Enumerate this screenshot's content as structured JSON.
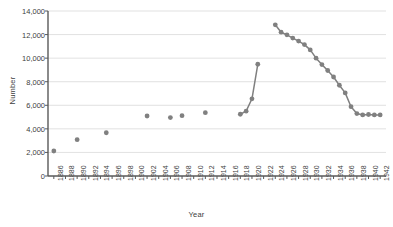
{
  "chart_data": {
    "type": "scatter",
    "title": "",
    "xlabel": "Year",
    "ylabel": "Number",
    "xlim": [
      1885,
      1943
    ],
    "ylim": [
      0,
      14000
    ],
    "grid": true,
    "legend": false,
    "marker_color": "#808080",
    "line_color": "#808080",
    "axis_color": "#595959",
    "grid_color": "#d9d9d9",
    "text_color": "#404040",
    "ytick_labels": [
      "0",
      "2,000",
      "4,000",
      "6,000",
      "8,000",
      "10,000",
      "12,000",
      "14,000"
    ],
    "ytick_values": [
      0,
      2000,
      4000,
      6000,
      8000,
      10000,
      12000,
      14000
    ],
    "xtick_labels": [
      "1886",
      "1888",
      "1890",
      "1892",
      "1894",
      "1896",
      "1898",
      "1900",
      "1902",
      "1904",
      "1906",
      "1908",
      "1910",
      "1912",
      "1914",
      "1916",
      "1918",
      "1920",
      "1922",
      "1924",
      "1926",
      "1928",
      "1930",
      "1932",
      "1934",
      "1936",
      "1938",
      "1940",
      "1942"
    ],
    "xtick_values": [
      1886,
      1888,
      1890,
      1892,
      1894,
      1896,
      1898,
      1900,
      1902,
      1904,
      1906,
      1908,
      1910,
      1912,
      1914,
      1916,
      1918,
      1920,
      1922,
      1924,
      1926,
      1928,
      1930,
      1932,
      1934,
      1936,
      1938,
      1940,
      1942
    ],
    "series": [
      {
        "name": "isolated-points",
        "connected": false,
        "points": [
          {
            "x": 1886,
            "y": 2120
          },
          {
            "x": 1890,
            "y": 3080
          },
          {
            "x": 1895,
            "y": 3670
          },
          {
            "x": 1902,
            "y": 5090
          },
          {
            "x": 1906,
            "y": 4960
          },
          {
            "x": 1908,
            "y": 5120
          },
          {
            "x": 1912,
            "y": 5370
          }
        ]
      },
      {
        "name": "rise-1918-1921",
        "connected": true,
        "points": [
          {
            "x": 1918,
            "y": 5240
          },
          {
            "x": 1919,
            "y": 5500
          },
          {
            "x": 1920,
            "y": 6550
          },
          {
            "x": 1921,
            "y": 9480
          }
        ]
      },
      {
        "name": "decline-1924-1942",
        "connected": true,
        "points": [
          {
            "x": 1924,
            "y": 12830
          },
          {
            "x": 1925,
            "y": 12200
          },
          {
            "x": 1926,
            "y": 11980
          },
          {
            "x": 1927,
            "y": 11700
          },
          {
            "x": 1928,
            "y": 11450
          },
          {
            "x": 1929,
            "y": 11150
          },
          {
            "x": 1930,
            "y": 10700
          },
          {
            "x": 1931,
            "y": 10000
          },
          {
            "x": 1932,
            "y": 9450
          },
          {
            "x": 1933,
            "y": 8950
          },
          {
            "x": 1934,
            "y": 8400
          },
          {
            "x": 1935,
            "y": 7700
          },
          {
            "x": 1936,
            "y": 7050
          },
          {
            "x": 1937,
            "y": 5880
          },
          {
            "x": 1938,
            "y": 5300
          },
          {
            "x": 1939,
            "y": 5180
          },
          {
            "x": 1940,
            "y": 5220
          },
          {
            "x": 1941,
            "y": 5180
          },
          {
            "x": 1942,
            "y": 5180
          }
        ]
      }
    ]
  }
}
